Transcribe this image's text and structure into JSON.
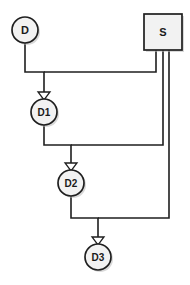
{
  "diagram": {
    "type": "flow-diagram",
    "background_color": "#ffffff",
    "line_color": "#1f1f1f",
    "node_fill_color": "#f2f2f2",
    "node_border_color": "#1f1f1f",
    "shadow_color": "#b9b9b9",
    "nodes": [
      {
        "id": "D",
        "label": "D",
        "shape": "circle",
        "cx": 25,
        "cy": 30,
        "r": 13,
        "font_size": 11
      },
      {
        "id": "S",
        "label": "S",
        "shape": "rectangle",
        "x": 144,
        "y": 14,
        "width": 38,
        "height": 36,
        "font_size": 11
      },
      {
        "id": "D1",
        "label": "D1",
        "shape": "circle",
        "cx": 44,
        "cy": 112,
        "r": 13,
        "font_size": 10
      },
      {
        "id": "D2",
        "label": "D2",
        "shape": "circle",
        "cx": 71,
        "cy": 183,
        "r": 13,
        "font_size": 10
      },
      {
        "id": "D3",
        "label": "D3",
        "shape": "circle",
        "cx": 98,
        "cy": 257,
        "r": 13,
        "font_size": 10
      }
    ],
    "edges": [
      {
        "id": "edge-d-to-d1",
        "from": "D",
        "to": "D1",
        "path": "M 25 43 L 25 72 L 44 72 L 44 95",
        "arrow_at": {
          "x": 44,
          "y": 99
        }
      },
      {
        "id": "edge-s-to-d1",
        "from": "S",
        "to": "D1",
        "path": "M 156 50 L 156 72 L 44 72"
      },
      {
        "id": "edge-d1-to-d2",
        "from": "D1",
        "to": "D2",
        "path": "M 44 125 L 44 145 L 71 145 L 71 166",
        "arrow_at": {
          "x": 71,
          "y": 170
        }
      },
      {
        "id": "edge-s-to-d2",
        "from": "S",
        "to": "D2",
        "path": "M 163 50 L 163 145 L 71 145"
      },
      {
        "id": "edge-d2-to-d3",
        "from": "D2",
        "to": "D3",
        "path": "M 71 196 L 71 218 L 98 218 L 98 240",
        "arrow_at": {
          "x": 98,
          "y": 244
        }
      },
      {
        "id": "edge-s-to-d3",
        "from": "S",
        "to": "D3",
        "path": "M 169 50 L 169 218 L 98 218"
      }
    ]
  }
}
